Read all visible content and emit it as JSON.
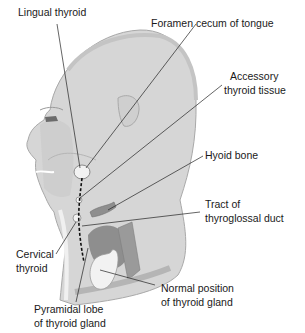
{
  "figure": {
    "colors": {
      "skin": "#d6d6d6",
      "skin_shadow": "#bdbdbd",
      "outline": "#a9a9a9",
      "thyroid": "#f2f2f2",
      "cartilage": "#8e8e8e",
      "muscle": "#9a9a9a",
      "leader_line": "#222222",
      "duct": "#111111",
      "text": "#1a1a1a"
    }
  },
  "labels": {
    "lingual_thyroid": "Lingual thyroid",
    "foramen_cecum": "Foramen cecum of tongue",
    "accessory_1": "Accessory",
    "accessory_2": "thyroid tissue",
    "hyoid_bone": "Hyoid bone",
    "tract_1": "Tract of",
    "tract_2": "thyroglossal duct",
    "cervical_1": "Cervical",
    "cervical_2": "thyroid",
    "normal_1": "Normal position",
    "normal_2": "of thyroid gland",
    "pyramidal_1": "Pyramidal lobe",
    "pyramidal_2": "of thyroid gland"
  }
}
